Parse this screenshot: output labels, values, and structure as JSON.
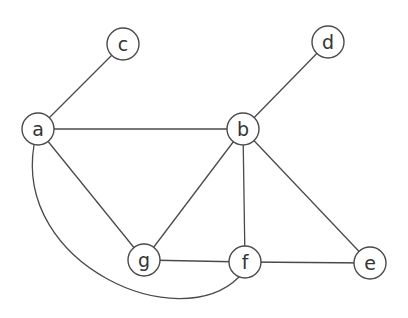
{
  "graph": {
    "nodes": [
      {
        "id": "a",
        "label": "a",
        "x": 38,
        "y": 129
      },
      {
        "id": "b",
        "label": "b",
        "x": 243,
        "y": 129
      },
      {
        "id": "c",
        "label": "c",
        "x": 123,
        "y": 44
      },
      {
        "id": "d",
        "label": "d",
        "x": 328,
        "y": 42
      },
      {
        "id": "e",
        "label": "e",
        "x": 370,
        "y": 263
      },
      {
        "id": "f",
        "label": "f",
        "x": 245,
        "y": 262
      },
      {
        "id": "g",
        "label": "g",
        "x": 144,
        "y": 260
      }
    ],
    "edges": [
      {
        "from": "a",
        "to": "c"
      },
      {
        "from": "a",
        "to": "b"
      },
      {
        "from": "a",
        "to": "g"
      },
      {
        "from": "a",
        "to": "f",
        "curved": true
      },
      {
        "from": "b",
        "to": "d"
      },
      {
        "from": "b",
        "to": "g"
      },
      {
        "from": "b",
        "to": "f"
      },
      {
        "from": "b",
        "to": "e"
      },
      {
        "from": "g",
        "to": "f"
      },
      {
        "from": "f",
        "to": "e"
      }
    ]
  }
}
